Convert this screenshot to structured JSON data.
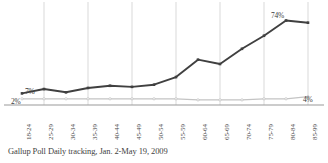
{
  "chart_data": {
    "type": "line",
    "title": "",
    "subtitle": "",
    "xlabel": "",
    "ylabel": "",
    "caption": "Gallup Poll Daily tracking, Jan. 2-May 19, 2009",
    "categories": [
      "18-24",
      "25-29",
      "30-34",
      "35-39",
      "40-44",
      "45-49",
      "50-54",
      "55-59",
      "60-64",
      "65-69",
      "70-74",
      "75-79",
      "80-84",
      "85-99"
    ],
    "ylim": [
      0,
      80
    ],
    "xlim_note": "categorical, 14 evenly spaced age brackets",
    "grid": "vertical gridlines at every other category; horizontal baseline axis only",
    "legend": "none",
    "series": [
      {
        "name": "primary",
        "color": "#404040",
        "marker": "filled-square",
        "values": [
          7,
          11,
          8,
          12,
          14,
          13,
          15,
          22,
          38,
          34,
          48,
          60,
          74,
          72
        ]
      },
      {
        "name": "secondary",
        "color": "#c4c4c4",
        "marker": "small-dot",
        "values": [
          2,
          2,
          2,
          2,
          2,
          2,
          2,
          2,
          1,
          1,
          1,
          2,
          2,
          4
        ]
      }
    ],
    "annotations": [
      {
        "id": "start-low",
        "text": "2%",
        "category": "18-24",
        "series": "secondary",
        "value": 2
      },
      {
        "id": "start-high",
        "text": "7%",
        "category": "18-24",
        "series": "primary",
        "value": 7
      },
      {
        "id": "peak",
        "text": "74%",
        "category": "80-84",
        "series": "primary",
        "value": 74
      },
      {
        "id": "end-low",
        "text": "4%",
        "category": "85-99",
        "series": "secondary",
        "value": 4
      }
    ]
  },
  "colors": {
    "primary_line": "#404040",
    "secondary_line": "#c4c4c4",
    "gridline": "#c9c9c9",
    "axis": "#9a9a9a",
    "label_text": "#3b3b3b",
    "tick_text": "#4a4a4a",
    "caption_text": "#3f3f3f",
    "background": "#ffffff"
  }
}
